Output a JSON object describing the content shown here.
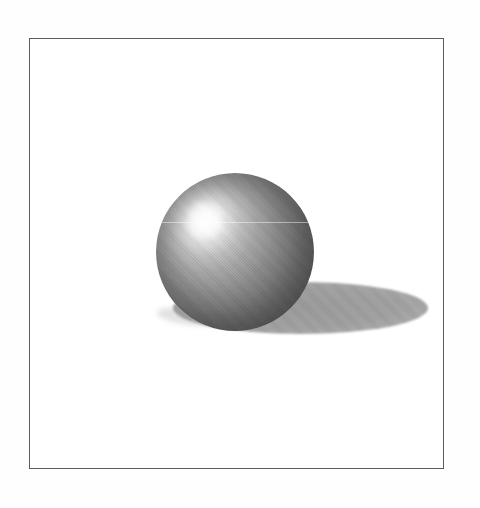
{
  "scene": {
    "description": "Grayscale halftone rendering of a shaded sphere with a white specular highlight in its upper left, resting on a plain white ground and casting a soft elliptical shadow to the lower right, enclosed in a thin dark rectangular frame on a white page. No text or controls are present.",
    "objects": [
      "figure-frame",
      "sphere",
      "specular-highlight",
      "cast-shadow",
      "contact-shadow",
      "scan-artifact-line"
    ],
    "colors": {
      "page-bg": "#fefefe",
      "frame-border": "#5c5c5c",
      "frame-bg": "#ffffff",
      "sphere-highlight": "#ffffff",
      "sphere-light": "#d8d8d8",
      "sphere-mid": "#8e8e8e",
      "sphere-dark": "#4d4d4d",
      "shadow-core": "#9a9a9a",
      "shadow-edge": "#c2c2c2",
      "contact-shadow": "#e2e2e2",
      "artifact-line": "rgba(255,255,255,0.45)"
    },
    "geometry": {
      "frame": {
        "left": "29px",
        "top": "38px",
        "width": "415px",
        "height": "431px"
      },
      "sphere": {
        "left": "156px",
        "top": "173px",
        "size": "158px",
        "highlight-x": "31%",
        "highlight-y": "30%"
      },
      "shadow": {
        "left": "173px",
        "top": "282px",
        "width": "255px",
        "height": "52px"
      },
      "contact": {
        "left": "157px",
        "top": "308px",
        "width": "64px",
        "height": "17px"
      }
    }
  }
}
